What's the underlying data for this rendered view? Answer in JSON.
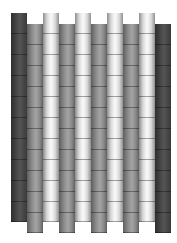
{
  "diagram": {
    "title": "",
    "colors": {
      "dark": "#3a3a3a",
      "gray": "#8a8a8a",
      "white": "#f2f2f2"
    },
    "segment_height": 21,
    "columns": [
      {
        "x": 11,
        "tone": "dark",
        "top": 13,
        "bottom": 222
      },
      {
        "x": 27,
        "tone": "gray",
        "top": 24,
        "bottom": 233
      },
      {
        "x": 43,
        "tone": "white",
        "top": 13,
        "bottom": 222
      },
      {
        "x": 59,
        "tone": "gray",
        "top": 24,
        "bottom": 233
      },
      {
        "x": 75,
        "tone": "white",
        "top": 13,
        "bottom": 222
      },
      {
        "x": 91,
        "tone": "gray",
        "top": 24,
        "bottom": 233
      },
      {
        "x": 107,
        "tone": "white",
        "top": 13,
        "bottom": 222
      },
      {
        "x": 123,
        "tone": "gray",
        "top": 24,
        "bottom": 233
      },
      {
        "x": 139,
        "tone": "white",
        "top": 13,
        "bottom": 222
      },
      {
        "x": 155,
        "tone": "dark",
        "top": 24,
        "bottom": 233
      }
    ]
  }
}
